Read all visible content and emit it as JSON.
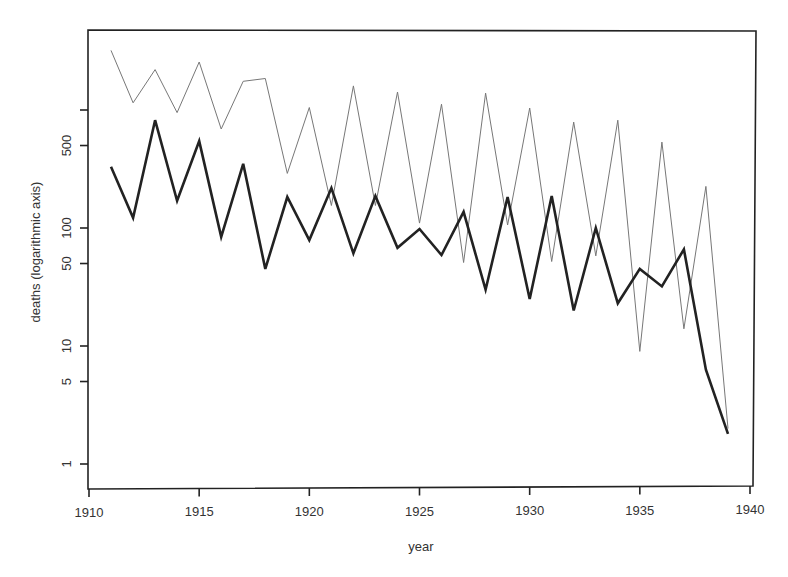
{
  "chart_data": {
    "type": "line",
    "title": "",
    "xlabel": "year",
    "ylabel": "deaths (logarithmic axis)",
    "yscale": "log",
    "xlim": [
      1910,
      1940
    ],
    "ylim": [
      0.6,
      4000
    ],
    "grid": false,
    "legend": null,
    "x_ticks": [
      1910,
      1915,
      1920,
      1925,
      1930,
      1935,
      1940
    ],
    "x_tick_labels": [
      "1910",
      "1915",
      "1920",
      "1925",
      "1930",
      "1935",
      "1940"
    ],
    "y_ticks": [
      1,
      5,
      10,
      50,
      100,
      500,
      1000
    ],
    "y_tick_labels": [
      "1",
      "5",
      "10",
      "50",
      "100",
      "500",
      ""
    ],
    "x": [
      1911,
      1912,
      1913,
      1914,
      1915,
      1916,
      1917,
      1918,
      1919,
      1920,
      1921,
      1922,
      1923,
      1924,
      1925,
      1926,
      1927,
      1928,
      1929,
      1930,
      1931,
      1932,
      1933,
      1934,
      1935,
      1936,
      1937,
      1938,
      1939
    ],
    "series": [
      {
        "name": "thin gray series",
        "color": "#777777",
        "line_width": 1,
        "values": [
          3200,
          1150,
          2200,
          950,
          2550,
          690,
          1750,
          1850,
          290,
          1050,
          155,
          1600,
          155,
          1420,
          110,
          1120,
          51,
          1390,
          106,
          1040,
          52,
          790,
          58,
          820,
          9,
          535,
          14,
          225,
          2
        ]
      },
      {
        "name": "thick black series",
        "color": "#222222",
        "line_width": 2.6,
        "values": [
          330,
          122,
          820,
          170,
          545,
          84,
          350,
          45,
          183,
          79,
          218,
          61,
          187,
          68,
          98,
          59,
          137,
          30,
          183,
          25,
          187,
          20,
          100,
          23,
          45,
          32,
          66,
          6.3,
          1.8
        ]
      }
    ]
  },
  "axes": {
    "x_title": "year",
    "y_title": "deaths (logarithmic axis)"
  }
}
